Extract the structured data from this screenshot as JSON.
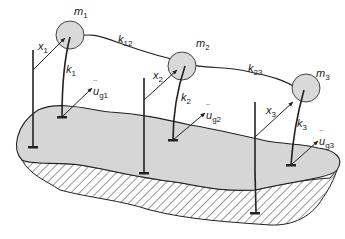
{
  "diagram": {
    "colors": {
      "line": "#222222",
      "mass_fill": "#d9d9d9",
      "ground_fill": "#d6d6d6",
      "hatch": "#333333",
      "background": "#ffffff"
    },
    "masses": [
      {
        "id": "m1",
        "symbol": "m",
        "sub": "1"
      },
      {
        "id": "m2",
        "symbol": "m",
        "sub": "2"
      },
      {
        "id": "m3",
        "symbol": "m",
        "sub": "3"
      }
    ],
    "stiffness": [
      {
        "id": "k1",
        "symbol": "k",
        "sub": "1"
      },
      {
        "id": "k2",
        "symbol": "k",
        "sub": "2"
      },
      {
        "id": "k3",
        "symbol": "k",
        "sub": "3"
      },
      {
        "id": "k12",
        "symbol": "k",
        "sub": "12"
      },
      {
        "id": "k23",
        "symbol": "k",
        "sub": "23"
      }
    ],
    "displacements": [
      {
        "id": "x1",
        "symbol": "x",
        "sub": "1"
      },
      {
        "id": "x2",
        "symbol": "x",
        "sub": "2"
      },
      {
        "id": "x3",
        "symbol": "x",
        "sub": "3"
      }
    ],
    "ground_accelerations": [
      {
        "id": "ug1",
        "symbol": "u",
        "sub": "g1"
      },
      {
        "id": "ug2",
        "symbol": "u",
        "sub": "g2"
      },
      {
        "id": "ug3",
        "symbol": "u",
        "sub": "g3"
      }
    ]
  }
}
